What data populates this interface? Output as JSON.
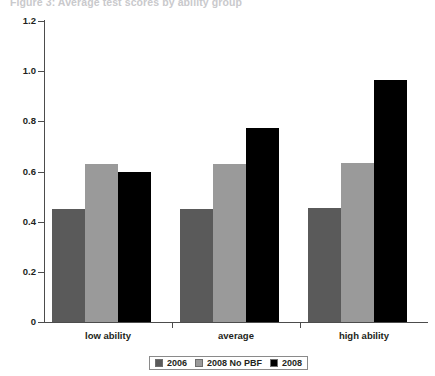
{
  "title_strip": {
    "text": "Figure 3: Average test scores by ability group"
  },
  "chart_data": {
    "type": "bar",
    "title": "",
    "xlabel": "",
    "ylabel": "",
    "categories": [
      "low ability",
      "average",
      "high ability"
    ],
    "series": [
      {
        "name": "2006",
        "color": "#5a5a5a",
        "values": [
          0.45,
          0.45,
          0.455
        ]
      },
      {
        "name": "2008 No PBF",
        "color": "#9a9a9a",
        "values": [
          0.63,
          0.63,
          0.635
        ]
      },
      {
        "name": "2008",
        "color": "#000000",
        "values": [
          0.6,
          0.775,
          0.965
        ]
      }
    ],
    "ylim": [
      0,
      1.2
    ],
    "ytick_labels": [
      "1.2",
      "1.0",
      "0.8",
      "0.6",
      "0.4",
      "0.2",
      "0"
    ],
    "ytick_values": [
      1.2,
      1.0,
      0.8,
      0.6,
      0.4,
      0.2,
      0
    ],
    "grid": false,
    "legend_position": "bottom-center"
  },
  "legend": {
    "items": [
      {
        "label": "2006",
        "color": "#5a5a5a"
      },
      {
        "label": "2008 No PBF",
        "color": "#9a9a9a"
      },
      {
        "label": "2008",
        "color": "#000000"
      }
    ]
  },
  "colors": {
    "series_2006": "#5a5a5a",
    "series_2008_no_pbf": "#9a9a9a",
    "series_2008": "#000000",
    "axis": "#4c4c4c",
    "text": "#231f20",
    "background": "#ffffff"
  }
}
